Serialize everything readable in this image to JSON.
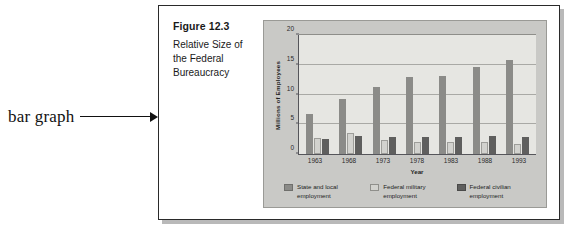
{
  "annotation": {
    "label": "bar graph",
    "arrow_icon": "arrow-right-icon"
  },
  "figure": {
    "caption_title": "Figure 12.3",
    "caption_subtitle": "Relative Size of the Federal Bureaucracy"
  },
  "chart_data": {
    "type": "bar",
    "title": "Relative Size of the Federal Bureaucracy",
    "xlabel": "Year",
    "ylabel": "Millions of Employees",
    "categories": [
      "1963",
      "1968",
      "1973",
      "1978",
      "1983",
      "1988",
      "1993"
    ],
    "yticks": [
      0,
      5,
      10,
      15,
      20
    ],
    "ylim": [
      0,
      20
    ],
    "grid": true,
    "legend_position": "bottom",
    "series": [
      {
        "name": "State and local employment",
        "color": "#8b8b88",
        "values": [
          6.8,
          9.2,
          11.2,
          13.0,
          13.1,
          14.7,
          15.8
        ]
      },
      {
        "name": "Federal military employment",
        "color": "#d2d2ce",
        "values": [
          2.7,
          3.6,
          2.3,
          2.1,
          2.1,
          2.1,
          1.7
        ]
      },
      {
        "name": "Federal civilian employment",
        "color": "#5f5f5e",
        "values": [
          2.6,
          3.0,
          2.8,
          2.9,
          2.8,
          3.0,
          2.9
        ]
      }
    ]
  }
}
